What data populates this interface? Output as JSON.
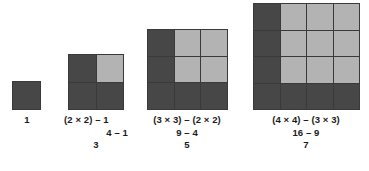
{
  "figure": {
    "background_color": "#ffffff",
    "dark_color": "#474747",
    "light_color": "#b3b3b3",
    "gridline_color": "#3a3a3a"
  },
  "groups": [
    {
      "id": "group-1",
      "n": 1,
      "cell_colors": [
        [
          "dark"
        ]
      ],
      "caption": {
        "align": "center",
        "lines": [
          "1"
        ]
      }
    },
    {
      "id": "group-2",
      "n": 2,
      "cell_colors": [
        [
          "dark",
          "light"
        ],
        [
          "dark",
          "dark"
        ]
      ],
      "caption": {
        "align": "mixed",
        "lines": [
          "(2 × 2) – 1",
          "4 – 1",
          "3"
        ]
      }
    },
    {
      "id": "group-3",
      "n": 3,
      "cell_colors": [
        [
          "dark",
          "light",
          "light"
        ],
        [
          "dark",
          "light",
          "light"
        ],
        [
          "dark",
          "dark",
          "dark"
        ]
      ],
      "caption": {
        "align": "center",
        "lines": [
          "(3 × 3) – (2 × 2)",
          "9 – 4",
          "5"
        ]
      }
    },
    {
      "id": "group-4",
      "n": 4,
      "cell_colors": [
        [
          "dark",
          "light",
          "light",
          "light"
        ],
        [
          "dark",
          "light",
          "light",
          "light"
        ],
        [
          "dark",
          "light",
          "light",
          "light"
        ],
        [
          "dark",
          "dark",
          "dark",
          "dark"
        ]
      ],
      "caption": {
        "align": "center",
        "lines": [
          "(4 × 4) – (3 × 3)",
          "16 – 9",
          "7"
        ]
      }
    }
  ],
  "captions": {
    "g1": {
      "l1": "1"
    },
    "g2": {
      "l1": "(2 × 2) – 1",
      "l2": "4 – 1",
      "l3": "3"
    },
    "g3": {
      "l1": "(3 × 3) – (2 × 2)",
      "l2": "9 – 4",
      "l3": "5"
    },
    "g4": {
      "l1": "(4 × 4) – (3 × 3)",
      "l2": "16 – 9",
      "l3": "7"
    }
  }
}
